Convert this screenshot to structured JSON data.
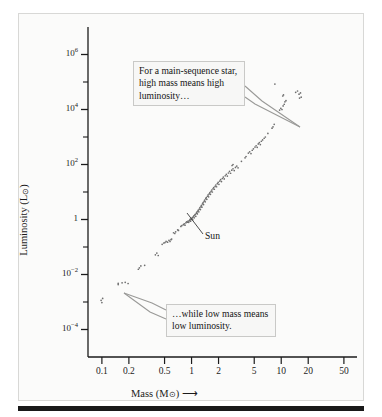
{
  "figure": {
    "background_color": "#fbfbfa",
    "frame_border_color": "#d8d8d6",
    "bottom_bar_color": "#191919"
  },
  "axes": {
    "x": {
      "label_text": "Mass (M",
      "label_sun": "⊙",
      "label_close": ")",
      "label_arrow": "⟶",
      "scale": "log",
      "range": [
        0.07,
        70
      ],
      "tick_values": [
        0.1,
        0.2,
        0.5,
        1,
        2,
        5,
        10,
        20,
        50
      ],
      "tick_labels": [
        "0.1",
        "0.2",
        "0.5",
        "1",
        "2",
        "5",
        "10",
        "20",
        "50"
      ]
    },
    "y": {
      "label_text": "Luminosity (L",
      "label_sun": "⊙",
      "label_close": ")",
      "label_arrow": "↑",
      "scale": "log",
      "range": [
        1e-05,
        10000000.0
      ],
      "tick_exponents": [
        6,
        5,
        4,
        3,
        2,
        1,
        0,
        -1,
        -2,
        -3,
        -4
      ],
      "major_tick_exponents": [
        6,
        4,
        2,
        0,
        -2,
        -4
      ],
      "major_tick_labels": [
        "10⁶",
        "10⁴",
        "10²",
        "1",
        "10⁻²",
        "10⁻⁴"
      ]
    }
  },
  "annotations": {
    "callout_high": {
      "text": "For a main-sequence star, high mass means high luminosity…",
      "target_mass": 6.3,
      "target_luminosity": 2200
    },
    "callout_low": {
      "text": "…while low mass means low luminosity.",
      "target_mass": 0.155,
      "target_luminosity": 0.0042
    },
    "sun_label": {
      "text": "Sun",
      "mass": 1.0,
      "luminosity": 1.0
    }
  },
  "chart_data": {
    "type": "scatter",
    "title": "",
    "xlabel": "Mass (M⊙)",
    "ylabel": "Luminosity (L⊙)",
    "xscale": "log",
    "yscale": "log",
    "xlim": [
      0.07,
      70
    ],
    "ylim": [
      1e-05,
      10000000.0
    ],
    "grid": false,
    "legend": null,
    "marker_color": "#6e6e6e",
    "marker_size_px": 1.7,
    "series": [
      {
        "name": "Main-sequence stars",
        "points": [
          [
            0.098,
            0.00115
          ],
          [
            0.102,
            0.00135
          ],
          [
            0.1,
            0.00095
          ],
          [
            0.152,
            0.0048
          ],
          [
            0.168,
            0.005
          ],
          [
            0.182,
            0.0052
          ],
          [
            0.196,
            0.0047
          ],
          [
            0.152,
            0.0043
          ],
          [
            0.255,
            0.0155
          ],
          [
            0.262,
            0.0175
          ],
          [
            0.272,
            0.0205
          ],
          [
            0.3,
            0.0215
          ],
          [
            0.395,
            0.052
          ],
          [
            0.41,
            0.06
          ],
          [
            0.425,
            0.049
          ],
          [
            0.47,
            0.125
          ],
          [
            0.49,
            0.14
          ],
          [
            0.505,
            0.145
          ],
          [
            0.52,
            0.16
          ],
          [
            0.54,
            0.15
          ],
          [
            0.56,
            0.175
          ],
          [
            0.575,
            0.16
          ],
          [
            0.59,
            0.185
          ],
          [
            0.6,
            0.195
          ],
          [
            0.63,
            0.33
          ],
          [
            0.65,
            0.31
          ],
          [
            0.665,
            0.355
          ],
          [
            0.7,
            0.42
          ],
          [
            0.715,
            0.4
          ],
          [
            0.76,
            0.56
          ],
          [
            0.78,
            0.6
          ],
          [
            0.81,
            0.65
          ],
          [
            0.83,
            0.7
          ],
          [
            0.845,
            0.62
          ],
          [
            0.865,
            0.76
          ],
          [
            0.88,
            0.82
          ],
          [
            0.9,
            0.8
          ],
          [
            0.915,
            0.88
          ],
          [
            0.93,
            0.79
          ],
          [
            0.945,
            0.9
          ],
          [
            0.955,
            0.95
          ],
          [
            0.965,
            1.02
          ],
          [
            0.975,
            0.87
          ],
          [
            0.985,
            1.05
          ],
          [
            1.0,
            1.0
          ],
          [
            1.01,
            1.1
          ],
          [
            1.02,
            1.18
          ],
          [
            1.03,
            0.98
          ],
          [
            1.045,
            1.25
          ],
          [
            1.06,
            1.35
          ],
          [
            1.07,
            1.15
          ],
          [
            1.085,
            1.45
          ],
          [
            1.1,
            1.55
          ],
          [
            1.115,
            1.3
          ],
          [
            1.13,
            1.7
          ],
          [
            1.145,
            1.85
          ],
          [
            1.16,
            1.6
          ],
          [
            1.175,
            2.0
          ],
          [
            1.19,
            2.2
          ],
          [
            1.205,
            1.9
          ],
          [
            1.22,
            2.4
          ],
          [
            1.24,
            2.7
          ],
          [
            1.255,
            2.3
          ],
          [
            1.275,
            3.0
          ],
          [
            1.29,
            3.3
          ],
          [
            1.305,
            2.8
          ],
          [
            1.325,
            3.7
          ],
          [
            1.345,
            4.1
          ],
          [
            1.36,
            3.5
          ],
          [
            1.38,
            4.6
          ],
          [
            1.4,
            5.1
          ],
          [
            1.42,
            4.4
          ],
          [
            1.44,
            5.7
          ],
          [
            1.46,
            6.3
          ],
          [
            1.48,
            5.4
          ],
          [
            1.505,
            7.0
          ],
          [
            1.53,
            7.8
          ],
          [
            1.55,
            6.7
          ],
          [
            1.575,
            8.6
          ],
          [
            1.6,
            9.5
          ],
          [
            1.625,
            8.2
          ],
          [
            1.65,
            10.5
          ],
          [
            1.68,
            11.8
          ],
          [
            1.705,
            10.0
          ],
          [
            1.735,
            13.0
          ],
          [
            1.765,
            14.5
          ],
          [
            1.795,
            12.6
          ],
          [
            1.83,
            16.0
          ],
          [
            1.865,
            18.0
          ],
          [
            1.9,
            15.5
          ],
          [
            1.94,
            20.0
          ],
          [
            1.98,
            22.5
          ],
          [
            2.02,
            19.0
          ],
          [
            2.065,
            25.0
          ],
          [
            2.11,
            28.0
          ],
          [
            2.155,
            24.0
          ],
          [
            2.205,
            31.0
          ],
          [
            2.26,
            35.0
          ],
          [
            2.315,
            30.0
          ],
          [
            2.375,
            39.0
          ],
          [
            2.44,
            44.0
          ],
          [
            2.505,
            38.0
          ],
          [
            2.575,
            49.0
          ],
          [
            2.65,
            56.0
          ],
          [
            2.725,
            48.0
          ],
          [
            2.81,
            62.0
          ],
          [
            2.9,
            70.0
          ],
          [
            2.99,
            60.0
          ],
          [
            3.09,
            78.0
          ],
          [
            3.195,
            88.0
          ],
          [
            3.3,
            76.0
          ],
          [
            2.83,
            92.0
          ],
          [
            2.9,
            100.0
          ],
          [
            3.6,
            130.0
          ],
          [
            3.95,
            175.0
          ],
          [
            4.05,
            195.0
          ],
          [
            4.3,
            260.0
          ],
          [
            4.45,
            290.0
          ],
          [
            4.6,
            250.0
          ],
          [
            4.75,
            330.0
          ],
          [
            4.9,
            370.0
          ],
          [
            5.1,
            430.0
          ],
          [
            5.25,
            480.0
          ],
          [
            5.4,
            420.0
          ],
          [
            5.55,
            560.0
          ],
          [
            5.7,
            620.0
          ],
          [
            5.85,
            530.0
          ],
          [
            6.0,
            700.0
          ],
          [
            6.2,
            780.0
          ],
          [
            6.45,
            900.0
          ],
          [
            6.65,
            1000.0
          ],
          [
            7.1,
            1350.0
          ],
          [
            7.9,
            2100.0
          ],
          [
            8.1,
            2350.0
          ],
          [
            8.35,
            2900.0
          ],
          [
            8.5,
            84000.0
          ],
          [
            9.6,
            9500.0
          ],
          [
            9.9,
            11000.0
          ],
          [
            10.2,
            10000.0
          ],
          [
            10.5,
            13500.0
          ],
          [
            10.8,
            15500.0
          ],
          [
            11.0,
            19000.0
          ],
          [
            11.3,
            21000.0
          ],
          [
            10.4,
            31000.0
          ],
          [
            10.6,
            34000.0
          ],
          [
            14.5,
            42000.0
          ],
          [
            15.2,
            47000.0
          ],
          [
            15.8,
            36000.0
          ],
          [
            16.4,
            40000.0
          ],
          [
            16.0,
            26000.0
          ],
          [
            16.7,
            28000.0
          ]
        ]
      }
    ]
  }
}
